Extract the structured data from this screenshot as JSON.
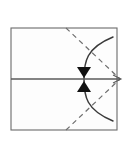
{
  "figure": {
    "type": "line-diagram",
    "canvas": {
      "width": 135,
      "height": 153,
      "background": "#ffffff"
    },
    "colors": {
      "frame_stroke": "#6b6b6b",
      "midline_stroke": "#5a5a5a",
      "arc_stroke": "#3a3a3a",
      "dashed_stroke": "#6e6e6e",
      "arrow_fill": "#111111",
      "interior_fill": "#fdfdfd"
    }
  },
  "shapes": {
    "rectangle": {
      "label": "outer rectangle",
      "x": 11,
      "y": 28,
      "width": 106,
      "height": 102,
      "stroke_width": 1.1
    },
    "midline": {
      "label": "horizontal midline",
      "x1": 11,
      "y1": 79,
      "x2": 120,
      "y2": 79,
      "stroke_width": 1.6
    },
    "arc": {
      "label": "circular arc bulging left",
      "start_x": 113,
      "start_y": 37,
      "end_x": 113,
      "end_y": 121,
      "apex_x": 84,
      "apex_y": 79,
      "stroke_width": 1.5
    },
    "dashed_line_upper": {
      "label": "dashed diagonal from top edge to right midpoint",
      "x1": 66,
      "y1": 28,
      "x2": 120,
      "y2": 79,
      "dash_pattern": "5 4",
      "stroke_width": 1.2
    },
    "dashed_line_lower": {
      "label": "dashed diagonal from bottom edge to right midpoint",
      "x1": 66,
      "y1": 130,
      "x2": 120,
      "y2": 79,
      "dash_pattern": "5 4",
      "stroke_width": 1.2
    },
    "arrow_down": {
      "label": "downward arrowhead above midline",
      "tip_x": 84,
      "tip_y": 78,
      "half_width": 7,
      "height": 11
    },
    "arrow_up": {
      "label": "upward arrowhead below midline",
      "tip_x": 84,
      "tip_y": 81,
      "half_width": 7,
      "height": 11
    },
    "right_tip": {
      "label": "convergence tip at right of midline",
      "x": 120,
      "y": 79
    }
  },
  "annotations": {
    "alt_text": "A rectangle divided by a horizontal midline, with two dashed diagonal lines meeting at the right end of the midline and a curved arc crossing the midline at its center, marked by two opposing arrowheads."
  }
}
